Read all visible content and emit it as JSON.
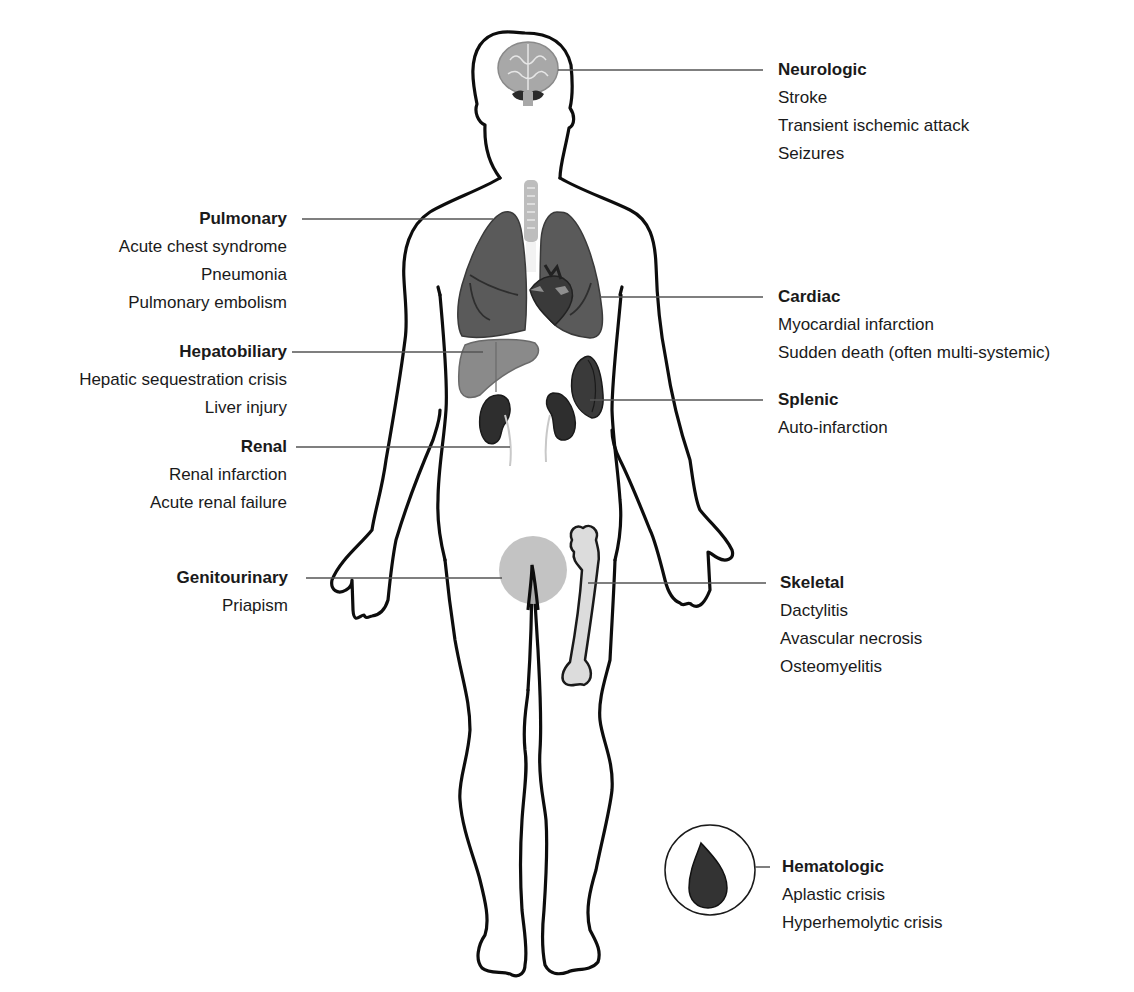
{
  "diagram": {
    "colors": {
      "outline": "#0d0d0d",
      "leader_line": "#555555",
      "brain": "#a8a8a8",
      "lung": "#5a5a5a",
      "heart": "#3a3a3a",
      "liver": "#8a8a8a",
      "kidney": "#2e2e2e",
      "spleen": "#3a3a3a",
      "genitourinary": "#bdbdbd",
      "bone": "#dcdcdc",
      "blood_drop": "#333333"
    },
    "systems": [
      {
        "id": "neurologic",
        "title": "Neurologic",
        "side": "right",
        "items": [
          "Stroke",
          "Transient ischemic attack",
          "Seizures"
        ]
      },
      {
        "id": "pulmonary",
        "title": "Pulmonary",
        "side": "left",
        "items": [
          "Acute chest syndrome",
          "Pneumonia",
          "Pulmonary embolism"
        ]
      },
      {
        "id": "cardiac",
        "title": "Cardiac",
        "side": "right",
        "items": [
          "Myocardial infarction",
          "Sudden death (often multi-systemic)"
        ]
      },
      {
        "id": "hepatobiliary",
        "title": "Hepatobiliary",
        "side": "left",
        "items": [
          "Hepatic sequestration crisis",
          "Liver injury"
        ]
      },
      {
        "id": "splenic",
        "title": "Splenic",
        "side": "right",
        "items": [
          "Auto-infarction"
        ]
      },
      {
        "id": "renal",
        "title": "Renal",
        "side": "left",
        "items": [
          "Renal infarction",
          "Acute renal failure"
        ]
      },
      {
        "id": "genitourinary",
        "title": "Genitourinary",
        "side": "left",
        "items": [
          "Priapism"
        ]
      },
      {
        "id": "skeletal",
        "title": "Skeletal",
        "side": "right",
        "items": [
          "Dactylitis",
          "Avascular necrosis",
          "Osteomyelitis"
        ]
      },
      {
        "id": "hematologic",
        "title": "Hematologic",
        "side": "right",
        "items": [
          "Aplastic crisis",
          "Hyperhemolytic crisis"
        ]
      }
    ],
    "icons": {
      "brain": "brain-icon",
      "lungs": "lungs-icon",
      "heart": "heart-icon",
      "liver": "liver-icon",
      "kidneys": "kidney-icon",
      "spleen": "spleen-icon",
      "genital_region": "genital-region-icon",
      "femur": "femur-bone-icon",
      "blood_drop": "blood-drop-icon"
    }
  }
}
